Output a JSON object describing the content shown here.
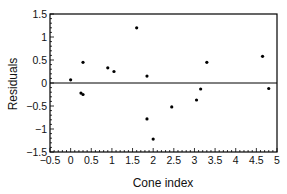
{
  "chart_data": {
    "type": "scatter",
    "title": "",
    "xlabel": "Cone index",
    "ylabel": "Residuals",
    "xlim": [
      -0.5,
      5
    ],
    "ylim": [
      -1.5,
      1.5
    ],
    "xticks": [
      -0.5,
      0,
      0.5,
      1,
      1.5,
      2,
      2.5,
      3,
      3.5,
      4,
      4.5,
      5
    ],
    "xtick_labels": [
      "−0.5",
      "0",
      "0.5",
      "1",
      "1.5",
      "2",
      "2.5",
      "3",
      "3.5",
      "4",
      "4.5",
      "5"
    ],
    "yticks": [
      1.5,
      1,
      0.5,
      0,
      -0.5,
      -1,
      -1.5
    ],
    "ytick_labels": [
      "1.5",
      "1",
      "0.5",
      "0",
      "−0.5",
      "−1",
      "−1.5"
    ],
    "grid": false,
    "legend": null,
    "reference_line": {
      "y": 0
    },
    "points": [
      {
        "x": 0.0,
        "y": 0.07
      },
      {
        "x": 0.3,
        "y": 0.45
      },
      {
        "x": 0.25,
        "y": -0.22
      },
      {
        "x": 0.3,
        "y": -0.25
      },
      {
        "x": 0.9,
        "y": 0.33
      },
      {
        "x": 1.05,
        "y": 0.25
      },
      {
        "x": 1.6,
        "y": 1.2
      },
      {
        "x": 1.85,
        "y": 0.15
      },
      {
        "x": 1.85,
        "y": -0.78
      },
      {
        "x": 2.0,
        "y": -1.22
      },
      {
        "x": 2.45,
        "y": -0.52
      },
      {
        "x": 3.05,
        "y": -0.37
      },
      {
        "x": 3.15,
        "y": -0.13
      },
      {
        "x": 3.3,
        "y": 0.45
      },
      {
        "x": 4.65,
        "y": 0.58
      },
      {
        "x": 4.8,
        "y": -0.12
      }
    ],
    "colors": {
      "marker": "#000000",
      "axis": "#000000",
      "background": "#ffffff"
    }
  }
}
